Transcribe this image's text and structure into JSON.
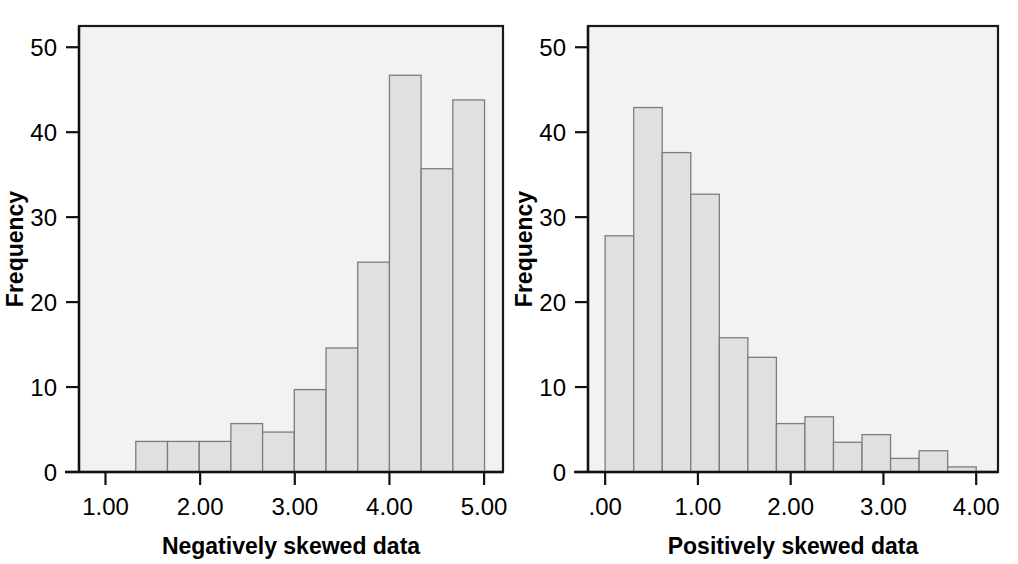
{
  "figure": {
    "panel_count": 2,
    "background_color": "#ffffff",
    "plot_background_color": "#f2f2f2",
    "bar_fill_color": "#e0e0e0",
    "bar_stroke_color": "#7d7d7d",
    "axis_color": "#111111"
  },
  "chart_data": [
    {
      "type": "bar",
      "id": "negatively-skewed-histogram",
      "title": "",
      "xlabel": "Negatively skewed data",
      "ylabel": "Frequency",
      "grid": false,
      "legend": false,
      "xlim": [
        0.72,
        5.2
      ],
      "ylim": [
        0,
        52.5
      ],
      "yticks": [
        0,
        10,
        20,
        30,
        40,
        50
      ],
      "yticklabels": [
        "0",
        "10",
        "20",
        "30",
        "40",
        "50"
      ],
      "xticks": [
        1.0,
        2.0,
        3.0,
        4.0,
        5.0
      ],
      "xticklabels": [
        "1.00",
        "2.00",
        "3.00",
        "4.00",
        "5.00"
      ],
      "bin_width": 0.335,
      "bin_edges": [
        1.32,
        1.655,
        1.99,
        2.325,
        2.66,
        2.995,
        3.33,
        3.665,
        4.0,
        4.335,
        4.67,
        5.005
      ],
      "categories": [
        "1.32-1.66",
        "1.66-1.99",
        "1.99-2.33",
        "2.33-2.66",
        "2.66-3.00",
        "3.00-3.33",
        "3.33-3.67",
        "3.67-4.00",
        "4.00-4.34",
        "4.34-4.67",
        "4.67-5.01"
      ],
      "values": [
        3.6,
        3.6,
        3.6,
        5.7,
        4.7,
        9.7,
        14.6,
        24.7,
        46.7,
        35.7,
        43.8
      ]
    },
    {
      "type": "bar",
      "id": "positively-skewed-histogram",
      "title": "",
      "xlabel": "Positively skewed data",
      "ylabel": "Frequency",
      "grid": false,
      "legend": false,
      "xlim": [
        -0.185,
        4.235
      ],
      "ylim": [
        0,
        52.5
      ],
      "yticks": [
        0,
        10,
        20,
        30,
        40,
        50
      ],
      "yticklabels": [
        "0",
        "10",
        "20",
        "30",
        "40",
        "50"
      ],
      "xticks": [
        0.0,
        1.0,
        2.0,
        3.0,
        4.0
      ],
      "xticklabels": [
        ".00",
        "1.00",
        "2.00",
        "3.00",
        "4.00"
      ],
      "bin_width": 0.3077,
      "bin_edges": [
        0.0,
        0.3077,
        0.6154,
        0.9231,
        1.2308,
        1.5385,
        1.8462,
        2.1538,
        2.4615,
        2.7692,
        3.0769,
        3.3846,
        3.6923,
        4.0
      ],
      "categories": [
        "0.00-0.31",
        "0.31-0.62",
        "0.62-0.92",
        "0.92-1.23",
        "1.23-1.54",
        "1.54-1.85",
        "1.85-2.15",
        "2.15-2.46",
        "2.46-2.77",
        "2.77-3.08",
        "3.08-3.38",
        "3.38-3.69",
        "3.69-4.00"
      ],
      "values": [
        27.8,
        42.9,
        37.6,
        32.7,
        15.8,
        13.5,
        5.7,
        6.5,
        3.5,
        4.4,
        1.6,
        2.5,
        0.6
      ]
    }
  ]
}
